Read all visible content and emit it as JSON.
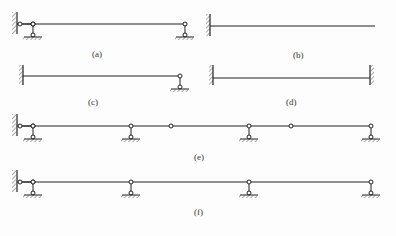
{
  "diagrams": [
    {
      "id": "a",
      "label": "(a)"
    },
    {
      "id": "b",
      "label": "(b)"
    },
    {
      "id": "c",
      "label": "(c)"
    },
    {
      "id": "d",
      "label": "(d)"
    },
    {
      "id": "e",
      "label": "(e)"
    },
    {
      "id": "f",
      "label": "(f)"
    }
  ],
  "colors": {
    "line": "#222222",
    "hatch": "#555555"
  }
}
